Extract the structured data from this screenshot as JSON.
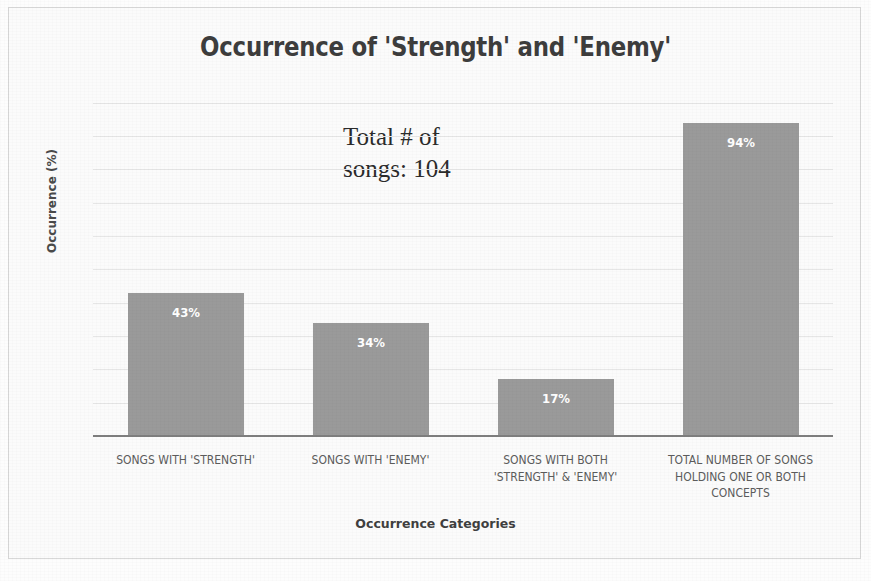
{
  "chart_data": {
    "type": "bar",
    "title": "Occurrence of 'Strength' and 'Enemy'",
    "xlabel": "Occurrence Categories",
    "ylabel": "Occurrence (%)",
    "ylim": [
      0,
      100
    ],
    "grid": true,
    "legend": null,
    "bar_color": "#9a9a9a",
    "label_color": "#ffffff",
    "categories": [
      "SONGS WITH 'STRENGTH'",
      "SONGS WITH 'ENEMY'",
      "SONGS WITH BOTH 'STRENGTH' & 'ENEMY'",
      "TOTAL NUMBER OF SONGS HOLDING ONE OR BOTH CONCEPTS"
    ],
    "category_lines": [
      [
        "SONGS WITH 'STRENGTH'"
      ],
      [
        "SONGS WITH 'ENEMY'"
      ],
      [
        "SONGS WITH BOTH",
        "'STRENGTH' & 'ENEMY'"
      ],
      [
        "TOTAL NUMBER OF SONGS",
        "HOLDING ONE OR BOTH",
        "CONCEPTS"
      ]
    ],
    "values": [
      43,
      34,
      17,
      94
    ],
    "data_labels": [
      "43%",
      "34%",
      "17%",
      "94%"
    ],
    "annotation": {
      "line1": "Total # of",
      "line2": "songs: 104"
    }
  }
}
